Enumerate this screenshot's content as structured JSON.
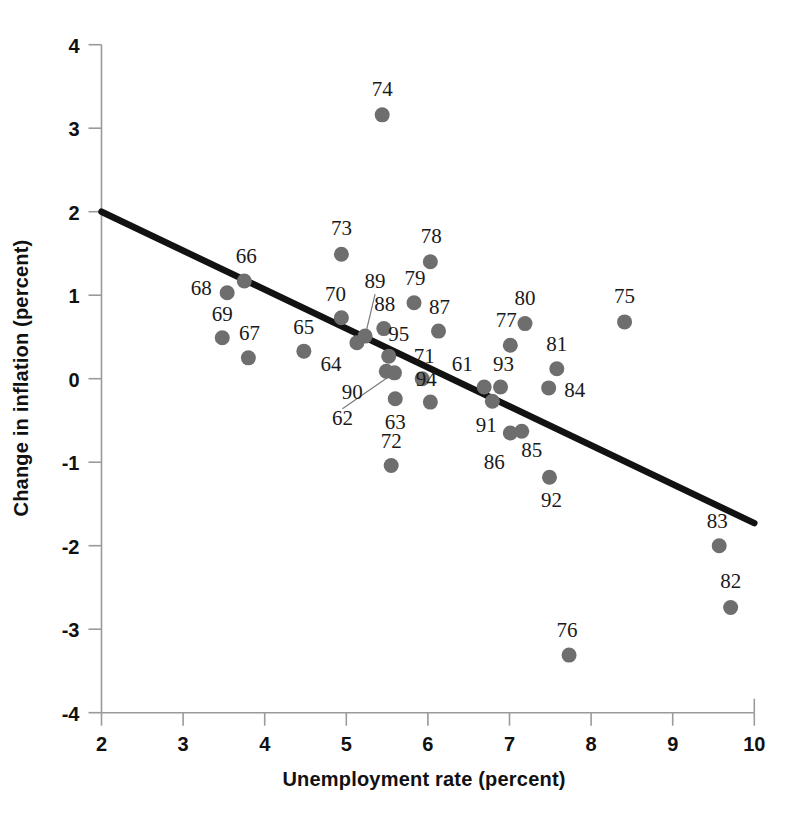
{
  "chart_data": {
    "type": "scatter",
    "title": "",
    "xlabel": "Unemployment rate (percent)",
    "ylabel": "Change in inflation (percent)",
    "xlim": [
      2,
      10
    ],
    "ylim": [
      -4,
      4
    ],
    "xticks": [
      "2",
      "3",
      "4",
      "5",
      "6",
      "7",
      "8",
      "9",
      "10"
    ],
    "yticks": [
      "4",
      "3",
      "2",
      "1",
      "0",
      "-1",
      "-2",
      "-3",
      "-4"
    ],
    "grid": false,
    "legend": null,
    "point_color": "#6e6e6e",
    "trendline_color": "#121212",
    "points": [
      {
        "label": "61",
        "x": 6.69,
        "y": -0.1,
        "label_dx": -22,
        "label_dy": -16
      },
      {
        "label": "62",
        "x": 5.59,
        "y": 0.07,
        "label_dx": -52,
        "label_dy": 52,
        "leader": true
      },
      {
        "label": "63",
        "x": 5.6,
        "y": -0.24,
        "label_dx": 0,
        "label_dy": 30
      },
      {
        "label": "64",
        "x": 5.13,
        "y": 0.43,
        "label_dx": -26,
        "label_dy": 28
      },
      {
        "label": "65",
        "x": 4.48,
        "y": 0.33,
        "label_dx": 0,
        "label_dy": -17
      },
      {
        "label": "66",
        "x": 3.75,
        "y": 1.17,
        "label_dx": 2,
        "label_dy": -18
      },
      {
        "label": "67",
        "x": 3.8,
        "y": 0.25,
        "label_dx": 1,
        "label_dy": -18
      },
      {
        "label": "68",
        "x": 3.54,
        "y": 1.03,
        "label_dx": -26,
        "label_dy": 2
      },
      {
        "label": "69",
        "x": 3.48,
        "y": 0.49,
        "label_dx": 0,
        "label_dy": -17
      },
      {
        "label": "70",
        "x": 4.94,
        "y": 0.73,
        "label_dx": -6,
        "label_dy": -17
      },
      {
        "label": "71",
        "x": 5.93,
        "y": 0.0,
        "label_dx": 2,
        "label_dy": -16
      },
      {
        "label": "72",
        "x": 5.55,
        "y": -1.04,
        "label_dx": 0,
        "label_dy": -18
      },
      {
        "label": "73",
        "x": 4.94,
        "y": 1.49,
        "label_dx": 0,
        "label_dy": -19
      },
      {
        "label": "74",
        "x": 5.44,
        "y": 3.16,
        "label_dx": 0,
        "label_dy": -19
      },
      {
        "label": "75",
        "x": 8.41,
        "y": 0.68,
        "label_dx": 0,
        "label_dy": -19
      },
      {
        "label": "76",
        "x": 7.73,
        "y": -3.31,
        "label_dx": -2,
        "label_dy": -18
      },
      {
        "label": "77",
        "x": 7.01,
        "y": 0.4,
        "label_dx": -4,
        "label_dy": -18
      },
      {
        "label": "78",
        "x": 6.03,
        "y": 1.4,
        "label_dx": 1,
        "label_dy": -19
      },
      {
        "label": "79",
        "x": 5.83,
        "y": 0.91,
        "label_dx": 1,
        "label_dy": -18
      },
      {
        "label": "80",
        "x": 7.19,
        "y": 0.66,
        "label_dx": 0,
        "label_dy": -19
      },
      {
        "label": "81",
        "x": 7.58,
        "y": 0.12,
        "label_dx": 0,
        "label_dy": -18
      },
      {
        "label": "82",
        "x": 9.71,
        "y": -2.74,
        "label_dx": 0,
        "label_dy": -19
      },
      {
        "label": "83",
        "x": 9.57,
        "y": -2.0,
        "label_dx": -2,
        "label_dy": -18
      },
      {
        "label": "84",
        "x": 7.48,
        "y": -0.11,
        "label_dx": 26,
        "label_dy": 9
      },
      {
        "label": "85",
        "x": 7.15,
        "y": -0.63,
        "label_dx": 10,
        "label_dy": 26
      },
      {
        "label": "86",
        "x": 7.01,
        "y": -0.65,
        "label_dx": -16,
        "label_dy": 36
      },
      {
        "label": "87",
        "x": 6.13,
        "y": 0.57,
        "label_dx": 1,
        "label_dy": -17
      },
      {
        "label": "88",
        "x": 5.46,
        "y": 0.6,
        "label_dx": 1,
        "label_dy": -18
      },
      {
        "label": "89",
        "x": 5.23,
        "y": 0.51,
        "label_dx": 10,
        "label_dy": -48,
        "leader": true
      },
      {
        "label": "90",
        "x": 5.49,
        "y": 0.09,
        "label_dx": -34,
        "label_dy": 28
      },
      {
        "label": "91",
        "x": 6.79,
        "y": -0.27,
        "label_dx": -6,
        "label_dy": 31
      },
      {
        "label": "92",
        "x": 7.49,
        "y": -1.18,
        "label_dx": 2,
        "label_dy": 30
      },
      {
        "label": "93",
        "x": 6.89,
        "y": -0.1,
        "label_dx": 3,
        "label_dy": -16
      },
      {
        "label": "94",
        "x": 6.03,
        "y": -0.28,
        "label_dx": -4,
        "label_dy": -16
      },
      {
        "label": "95",
        "x": 5.52,
        "y": 0.27,
        "label_dx": 10,
        "label_dy": -15
      }
    ],
    "trendline": {
      "x1": 2.0,
      "y1": 2.0,
      "x2": 10.0,
      "y2": -1.73
    }
  }
}
